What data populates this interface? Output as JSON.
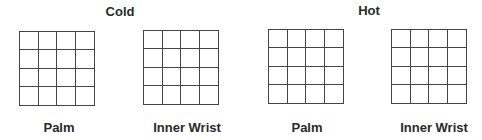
{
  "groups": [
    {
      "title": "Cold",
      "panels": [
        {
          "label": "Palm",
          "rows": 4,
          "cols": 4
        },
        {
          "label": "Inner Wrist",
          "rows": 4,
          "cols": 4
        }
      ]
    },
    {
      "title": "Hot",
      "panels": [
        {
          "label": "Palm",
          "rows": 4,
          "cols": 4
        },
        {
          "label": "Inner Wrist",
          "rows": 4,
          "cols": 4
        }
      ]
    }
  ],
  "colors": {
    "line": "#444444",
    "text": "#2a2a2a",
    "background": "#ffffff"
  }
}
